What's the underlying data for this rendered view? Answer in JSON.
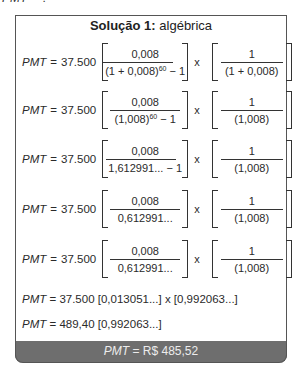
{
  "header_cut": {
    "lhs": "PMT",
    "rest": " = ?"
  },
  "box": {
    "title_bold": "Solução 1:",
    "title_rest": " algébrica",
    "lhs": "PMT",
    "eq": "=",
    "coef": "37.500",
    "times": "x",
    "rows": [
      {
        "num1": "0,008",
        "den1_a": "(1 + 0,008)",
        "den1_sup": "60",
        "den1_b": " − 1",
        "num2": "1",
        "den2": "(1 + 0,008)"
      },
      {
        "num1": "0,008",
        "den1_a": "(1,008)",
        "den1_sup": "60",
        "den1_b": " − 1",
        "num2": "1",
        "den2": "(1,008)"
      },
      {
        "num1": "0,008",
        "den1_a": "1,612991... − 1",
        "den1_sup": "",
        "den1_b": "",
        "num2": "1",
        "den2": "(1,008)"
      },
      {
        "num1": "0,008",
        "den1_a": "0,612991...",
        "den1_sup": "",
        "den1_b": "",
        "num2": "1",
        "den2": "(1,008)"
      },
      {
        "num1": "0,008",
        "den1_a": "0,612991...",
        "den1_sup": "",
        "den1_b": "",
        "num2": "1",
        "den2": "(1,008)"
      }
    ],
    "line6": " = 37.500 [0,013051...] x [0,992063...]",
    "line7": " = 489,40 [0,992063...]",
    "result_rest": " = R$ 485,52"
  },
  "colors": {
    "footer_bg": "#6e6e6e",
    "footer_text": "#ececec",
    "border": "#555555"
  }
}
